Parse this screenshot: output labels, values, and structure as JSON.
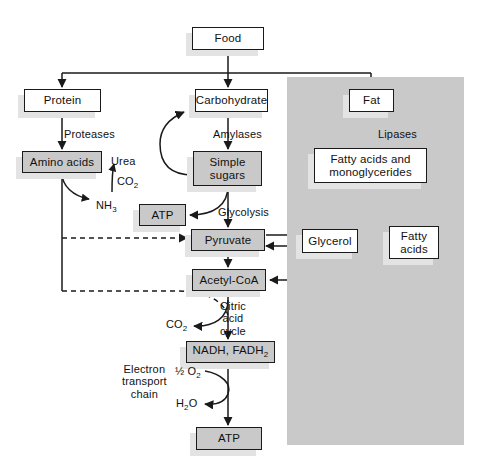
{
  "diagram": {
    "colors": {
      "page_background": "#ffffff",
      "panel_fill": "#c9c9c9",
      "box_fill_white": "#ffffff",
      "box_fill_gray": "#c9c9c9",
      "stroke": "#1a1a1a",
      "shadow": "#e3e3e3"
    },
    "panel": {
      "name": "lipid-pathway-panel",
      "x": 287,
      "y": 77,
      "width": 177,
      "height": 368
    },
    "nodes": [
      {
        "id": "food",
        "label": "Food",
        "fill": "white",
        "x": 192,
        "y": 27,
        "w": 72,
        "h": 23
      },
      {
        "id": "protein",
        "label": "Protein",
        "fill": "white",
        "x": 24,
        "y": 89,
        "w": 77,
        "h": 23
      },
      {
        "id": "carbohydrate",
        "label": "Carbohydrate",
        "fill": "white",
        "x": 195,
        "y": 89,
        "w": 73,
        "h": 23
      },
      {
        "id": "fat",
        "label": "Fat",
        "fill": "white",
        "x": 349,
        "y": 89,
        "w": 45,
        "h": 23
      },
      {
        "id": "amino-acids",
        "label": "Amino acids",
        "fill": "gray",
        "x": 22,
        "y": 151,
        "w": 80,
        "h": 22
      },
      {
        "id": "simple-sugars",
        "label": "Simple\nsugars",
        "fill": "gray",
        "x": 193,
        "y": 151,
        "w": 69,
        "h": 35
      },
      {
        "id": "fatty-mono",
        "label": "Fatty acids and\nmonoglycerides",
        "fill": "white",
        "x": 314,
        "y": 148,
        "w": 113,
        "h": 35
      },
      {
        "id": "atp-glycolysis",
        "label": "ATP",
        "fill": "gray",
        "x": 139,
        "y": 204,
        "w": 47,
        "h": 22
      },
      {
        "id": "pyruvate",
        "label": "Pyruvate",
        "fill": "gray",
        "x": 191,
        "y": 229,
        "w": 74,
        "h": 22
      },
      {
        "id": "glycerol",
        "label": "Glycerol",
        "fill": "white",
        "x": 302,
        "y": 229,
        "w": 56,
        "h": 24
      },
      {
        "id": "fatty-acids",
        "label": "Fatty\nacids",
        "fill": "white",
        "x": 389,
        "y": 226,
        "w": 50,
        "h": 33
      },
      {
        "id": "acetyl-coa",
        "label": "Acetyl-CoA",
        "fill": "gray",
        "x": 192,
        "y": 269,
        "w": 74,
        "h": 22
      },
      {
        "id": "nadh-fadh2",
        "label": "NADH, FADH",
        "label_sub": "2",
        "fill": "gray",
        "x": 186,
        "y": 341,
        "w": 89,
        "h": 22
      },
      {
        "id": "atp-final",
        "label": "ATP",
        "fill": "gray",
        "x": 196,
        "y": 427,
        "w": 66,
        "h": 23
      }
    ],
    "labels": [
      {
        "id": "proteases",
        "text": "Proteases",
        "x": 64,
        "y": 128
      },
      {
        "id": "amylases",
        "text": "Amylases",
        "x": 213,
        "y": 128
      },
      {
        "id": "lipases",
        "text": "Lipases",
        "x": 378,
        "y": 128
      },
      {
        "id": "urea",
        "text": "Urea",
        "x": 111,
        "y": 155
      },
      {
        "id": "co2-urea",
        "text": "CO",
        "sub": "2",
        "x": 117,
        "y": 175
      },
      {
        "id": "nh3",
        "text": "NH",
        "sub": "3",
        "x": 96,
        "y": 199
      },
      {
        "id": "glycolysis",
        "text": "Glycolysis",
        "x": 218,
        "y": 206
      },
      {
        "id": "citric",
        "text": "Citric\nacid\ncycle",
        "x": 220,
        "y": 300
      },
      {
        "id": "co2-citric",
        "text": "CO",
        "sub": "2",
        "x": 166,
        "y": 318
      },
      {
        "id": "etc",
        "text": "Electron\ntransport\nchain",
        "x": 122,
        "y": 363
      },
      {
        "id": "half-o2",
        "text": "½ O",
        "sub": "2",
        "x": 175,
        "y": 365
      },
      {
        "id": "h2o",
        "text": "H",
        "sub": "2",
        "text2": "O",
        "x": 176,
        "y": 397
      }
    ],
    "flows": [
      {
        "from": "Food",
        "to": "Protein"
      },
      {
        "from": "Food",
        "to": "Carbohydrate"
      },
      {
        "from": "Food",
        "to": "Fat"
      },
      {
        "from": "Protein",
        "to": "Amino acids",
        "via": "Proteases"
      },
      {
        "from": "Carbohydrate",
        "to": "Simple sugars",
        "via": "Amylases"
      },
      {
        "from": "Fat",
        "to": "Fatty acids and monoglycerides",
        "via": "Lipases"
      },
      {
        "from": "Simple sugars",
        "to": "Carbohydrate",
        "via": "curved return"
      },
      {
        "from": "Amino acids",
        "to": "NH3 + Urea + CO2"
      },
      {
        "from": "Simple sugars",
        "to": "ATP",
        "via": "Glycolysis"
      },
      {
        "from": "Simple sugars",
        "to": "Pyruvate",
        "via": "Glycolysis"
      },
      {
        "from": "Amino acids",
        "to": "Pyruvate",
        "style": "dashed"
      },
      {
        "from": "Amino acids",
        "to": "Citric acid cycle",
        "style": "dashed"
      },
      {
        "from": "Pyruvate",
        "to": "Glycerol"
      },
      {
        "from": "Glycerol",
        "to": "Pyruvate"
      },
      {
        "from": "Pyruvate",
        "to": "Acetyl-CoA"
      },
      {
        "from": "Fatty acids and monoglycerides",
        "to": "Glycerol"
      },
      {
        "from": "Fatty acids and monoglycerides",
        "to": "Fatty acids"
      },
      {
        "from": "Fatty acids",
        "to": "Acetyl-CoA"
      },
      {
        "from": "Acetyl-CoA",
        "to": "NADH, FADH2",
        "via": "Citric acid cycle"
      },
      {
        "from": "Citric acid cycle",
        "to": "CO2"
      },
      {
        "from": "NADH, FADH2",
        "to": "ATP",
        "via": "Electron transport chain"
      },
      {
        "from": "½ O2",
        "to": "H2O",
        "via": "Electron transport chain"
      }
    ]
  }
}
